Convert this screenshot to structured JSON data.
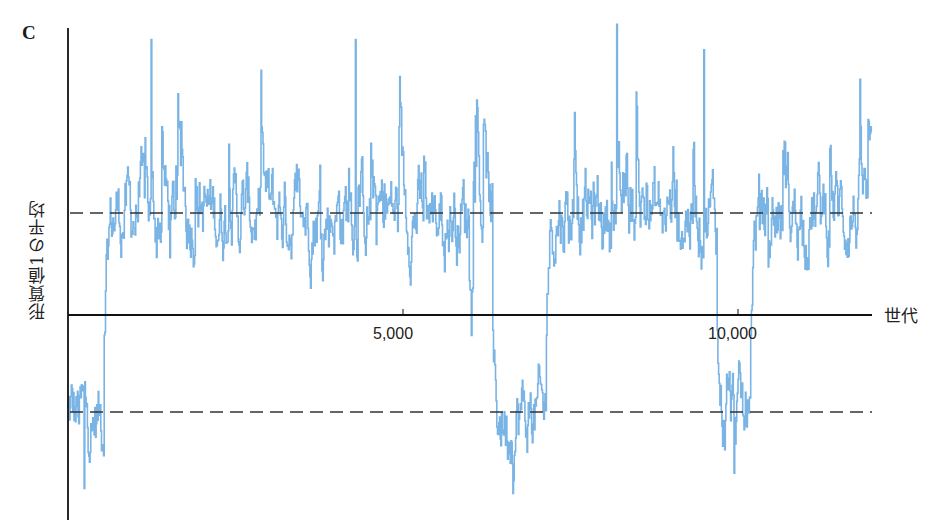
{
  "panel_label": "C",
  "chart_data": {
    "type": "line",
    "title": "",
    "xlabel": "世代",
    "ylabel": "形質値1の平均",
    "xlim": [
      0,
      12000
    ],
    "x_ticks": [
      {
        "value": 5000,
        "label": "5,000"
      },
      {
        "value": 10000,
        "label": "10,000"
      }
    ],
    "y_ticks": [],
    "reference_lines": [
      {
        "name": "upper-equilibrium",
        "y": 1.0,
        "style": "dashed"
      },
      {
        "name": "lower-equilibrium",
        "y": -1.0,
        "style": "dashed"
      },
      {
        "name": "zero-axis",
        "y": 0.0,
        "style": "solid"
      }
    ],
    "ylim": [
      -2.1,
      2.9
    ],
    "series": [
      {
        "name": "mean trait value 1",
        "color": "#7ab4e4",
        "regimes": [
          {
            "x_start": 0,
            "x_end": 550,
            "level": -1.0,
            "description": "lower equilibrium"
          },
          {
            "x_start": 550,
            "x_end": 6350,
            "level": 1.0,
            "description": "upper equilibrium"
          },
          {
            "x_start": 6350,
            "x_end": 7150,
            "level": -1.0,
            "description": "lower equilibrium"
          },
          {
            "x_start": 7150,
            "x_end": 9700,
            "level": 1.0,
            "description": "upper equilibrium"
          },
          {
            "x_start": 9700,
            "x_end": 10200,
            "level": -1.0,
            "description": "lower equilibrium"
          },
          {
            "x_start": 10200,
            "x_end": 12000,
            "level": 1.0,
            "description": "upper equilibrium"
          }
        ],
        "notable_points": [
          {
            "x": 1250,
            "y": 2.7
          },
          {
            "x": 4300,
            "y": 2.7
          },
          {
            "x": 8200,
            "y": 2.85
          },
          {
            "x": 9500,
            "y": 2.6
          },
          {
            "x": 6650,
            "y": -1.75
          },
          {
            "x": 9950,
            "y": -1.55
          },
          {
            "x": 250,
            "y": -1.7
          }
        ]
      }
    ],
    "grid": false,
    "legend": null
  }
}
